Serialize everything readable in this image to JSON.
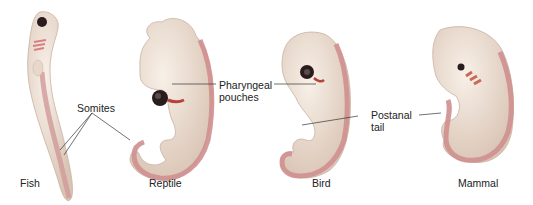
{
  "figure": {
    "embryos": [
      {
        "id": "fish",
        "caption": "Fish"
      },
      {
        "id": "reptile",
        "caption": "Reptile"
      },
      {
        "id": "bird",
        "caption": "Bird"
      },
      {
        "id": "mammal",
        "caption": "Mammal"
      }
    ],
    "labels": {
      "somites": "Somites",
      "pharyngeal_line1": "Pharyngeal",
      "pharyngeal_line2": "pouches",
      "postanal_line1": "Postanal",
      "postanal_line2": "tail"
    },
    "colors": {
      "body": "#f1e6dc",
      "body_shade": "#dcc9bb",
      "somite_band": "#c98a8a",
      "pouch": "#b5443f",
      "eye": "#2a1c1c",
      "leader_line": "#333333"
    }
  }
}
